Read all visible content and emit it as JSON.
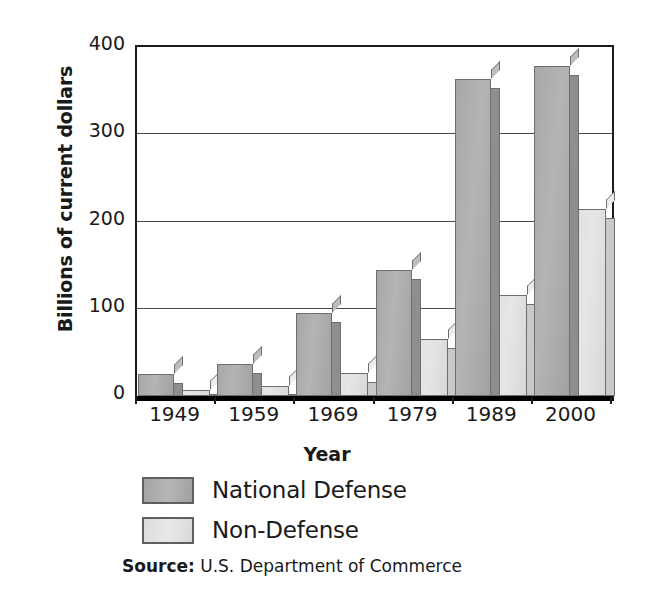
{
  "chart_data": {
    "type": "bar",
    "title": "",
    "xlabel": "Year",
    "ylabel": "Billions of current dollars",
    "categories": [
      "1949",
      "1959",
      "1969",
      "1979",
      "1989",
      "2000"
    ],
    "series": [
      {
        "name": "National Defense",
        "color": "#ababab",
        "values": [
          25,
          37,
          95,
          145,
          363,
          378
        ]
      },
      {
        "name": "Non-Defense",
        "color": "#e0e0e0",
        "values": [
          7,
          12,
          26,
          65,
          116,
          214
        ]
      }
    ],
    "ylim": [
      0,
      400
    ],
    "yticks": [
      0,
      100,
      200,
      300,
      400
    ],
    "ytick_labels": [
      "0",
      "100",
      "200",
      "300",
      "400"
    ],
    "grid": true,
    "legend_position": "below-axis-left",
    "annotations": {
      "source_prefix": "Source:",
      "source_text": "U.S. Department of Commerce"
    }
  },
  "axes": {
    "y_title": "Billions of current dollars",
    "x_title": "Year"
  },
  "legend": {
    "items": [
      {
        "label": "National Defense",
        "swatch": "dark-gray"
      },
      {
        "label": "Non-Defense",
        "swatch": "light-gray"
      }
    ]
  },
  "source": {
    "prefix": "Source:",
    "text": "U.S. Department of Commerce"
  }
}
